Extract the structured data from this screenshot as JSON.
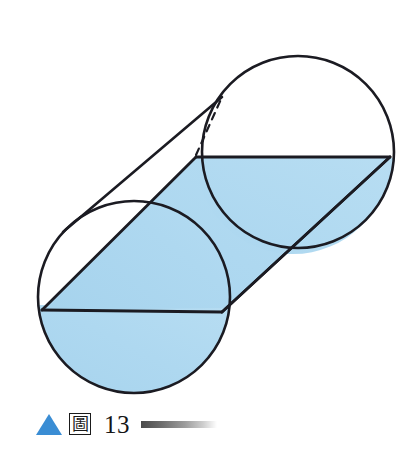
{
  "page": {
    "background_color": "#ffffff",
    "width": 414,
    "height": 458
  },
  "figure": {
    "colors": {
      "water_fill": "#a9d6ef",
      "water_fill_end": "#b6dcf1",
      "outline": "#1b1b22",
      "hidden_edge": "#1b1b22",
      "caption_triangle": "#3a8dd4"
    },
    "stroke_width_outline": 2.6,
    "stroke_width_chord": 2.8,
    "stroke_width_hidden": 2.2,
    "near_end": {
      "label": "near-circular-end",
      "center_x": 134,
      "center_y": 297,
      "radius": 96
    },
    "far_end": {
      "label": "far-circular-end",
      "center_x": 298,
      "center_y": 152,
      "radius": 96
    },
    "water_surface": {
      "label": "water-surface-parallelogram",
      "near_left_x": 42,
      "near_left_y": 310,
      "near_right_x": 222,
      "near_right_y": 312,
      "far_left_x": 196,
      "far_left_y": 157,
      "far_right_x": 390,
      "far_right_y": 157
    },
    "hidden_edge": {
      "label": "hidden-top-edge-dashed",
      "from_x": 196,
      "from_y": 155,
      "to_x": 222,
      "to_y": 97
    }
  },
  "caption": {
    "triangle_marker": "triangle-marker",
    "figure_char": "圖",
    "figure_number": "13",
    "rule": "gradient-rule"
  }
}
